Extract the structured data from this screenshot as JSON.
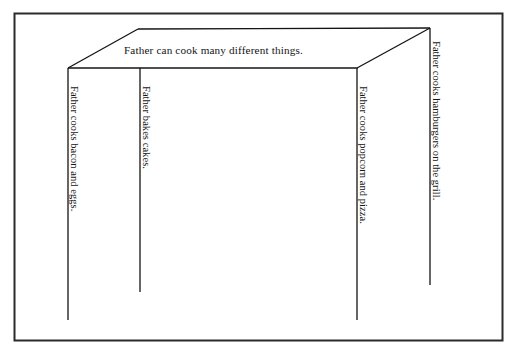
{
  "document": {
    "type": "graphic-organizer-worksheet",
    "shape": "three-dimensional-table-box",
    "background_color": "#ffffff",
    "ink_color": "#141414",
    "border": {
      "name": "page-border-rectangle",
      "x": 14,
      "y": 13,
      "width": 489,
      "height": 328
    }
  },
  "organizer": {
    "main_idea": "Father can cook many different things.",
    "details": [
      {
        "id": "leg-1",
        "text": "Father cooks bacon and eggs.",
        "line_x": 68,
        "line_top": 68,
        "line_bottom": 320
      },
      {
        "id": "leg-2",
        "text": "Father bakes cakes.",
        "line_x": 140,
        "line_top": 68,
        "line_bottom": 292
      },
      {
        "id": "leg-3",
        "text": "Father cooks popcorn and pizza.",
        "line_x": 357,
        "line_top": 68,
        "line_bottom": 320
      },
      {
        "id": "leg-4",
        "text": "Father cooks hamburgers on the grill.",
        "line_x": 430,
        "line_top": 28,
        "line_bottom": 285
      }
    ]
  },
  "geometry": {
    "front_top_edge": {
      "x1": 68,
      "y1": 68,
      "x2": 357,
      "y2": 68
    },
    "back_top_edge": {
      "x1": 138,
      "y1": 29,
      "x2": 430,
      "y2": 28
    },
    "diagonal_left": {
      "x1": 68,
      "y1": 68,
      "x2": 138,
      "y2": 29
    },
    "diagonal_right": {
      "x1": 357,
      "y1": 68,
      "x2": 430,
      "y2": 28
    }
  }
}
